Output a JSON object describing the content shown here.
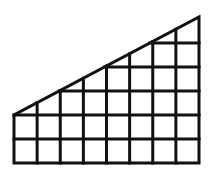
{
  "diagram": {
    "shape": "right-trapezoid",
    "columns": 8,
    "rows_at_left": 2,
    "rows_at_right": 6,
    "stroke_color": "#111111",
    "background_color": "#ffffff",
    "stroke_width": 3,
    "geometry": {
      "left_x": 14,
      "right_x": 199,
      "bottom_y": 163,
      "left_top_y": 115,
      "right_top_y": 17,
      "col_width": 23.125,
      "row_height": 24
    }
  }
}
